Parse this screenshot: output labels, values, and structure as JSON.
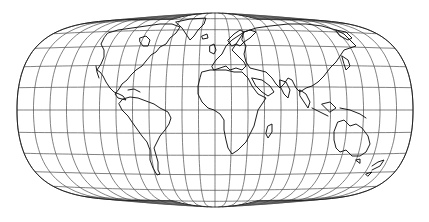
{
  "map": {
    "projection": "flat-polar equal-area world map",
    "graticule_interval_deg": 15,
    "colors": {
      "background": "#ffffff",
      "graticule": "#4a4a4a",
      "coastline": "#111111",
      "outline": "#222222"
    },
    "frame": {
      "cx": 215,
      "cy": 110,
      "half_width": 198,
      "half_height": 97,
      "pole_line_half_width": 42
    },
    "parallels_deg": [
      -75,
      -60,
      -45,
      -30,
      -15,
      0,
      15,
      30,
      45,
      60,
      75
    ],
    "meridians_deg": [
      -180,
      -165,
      -150,
      -135,
      -120,
      -105,
      -90,
      -75,
      -60,
      -45,
      -30,
      -15,
      0,
      15,
      30,
      45,
      60,
      75,
      90,
      105,
      120,
      135,
      150,
      165,
      180
    ],
    "continents": [
      "North America",
      "South America",
      "Europe",
      "Africa",
      "Asia",
      "Australia",
      "Greenland",
      "Madagascar",
      "New Zealand",
      "Japan",
      "Indonesia"
    ]
  }
}
